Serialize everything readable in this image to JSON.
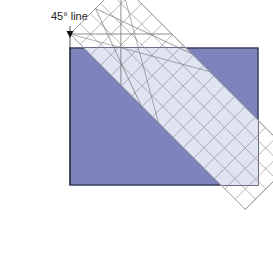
{
  "diagram": {
    "annotation_label": "45° line",
    "colors": {
      "fabric": "#7c84bb",
      "fabric_border": "#3a3f5e",
      "ruler_overlay": "#dfe3f2",
      "grid_line": "#8a8a8a",
      "background": "#ffffff"
    },
    "fabric_rect": {
      "x": 70,
      "y": 48,
      "width": 188,
      "height": 137
    },
    "ruler": {
      "top_corner": [
        70,
        34
      ],
      "width": 72,
      "length": 248,
      "angle_deg": 45,
      "grid_cols": 5,
      "grid_rows": 17
    },
    "guide_line_x": 70
  }
}
